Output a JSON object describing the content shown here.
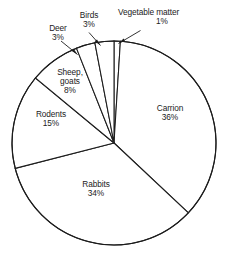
{
  "chart_data": {
    "type": "pie",
    "title": "",
    "subtitle": "",
    "xlabel": "",
    "ylabel": "",
    "grid": false,
    "legend_position": "none",
    "label_style": "slice-labels-with-leader-lines",
    "units": "percent",
    "start_angle_deg": 0,
    "direction": "clockwise",
    "categories": [
      "Vegetable matter",
      "Carrion",
      "Rabbits",
      "Rodents",
      "Sheep, goats",
      "Birds",
      "Deer"
    ],
    "values": [
      1,
      36,
      34,
      15,
      8,
      3,
      3
    ],
    "total": 100,
    "slices": [
      {
        "id": "vegetable",
        "name": "Vegetable matter",
        "value": 1,
        "value_text": "1%",
        "label_placement": "outside",
        "start_pct": 0,
        "end_pct": 1,
        "color": "#ffffff",
        "stroke": "#1c1c1c"
      },
      {
        "id": "carrion",
        "name": "Carrion",
        "value": 36,
        "value_text": "36%",
        "label_placement": "inside",
        "start_pct": 1,
        "end_pct": 37,
        "color": "#ffffff",
        "stroke": "#1c1c1c"
      },
      {
        "id": "rabbits",
        "name": "Rabbits",
        "value": 34,
        "value_text": "34%",
        "label_placement": "inside",
        "start_pct": 37,
        "end_pct": 71,
        "color": "#ffffff",
        "stroke": "#1c1c1c"
      },
      {
        "id": "rodents",
        "name": "Rodents",
        "value": 15,
        "value_text": "15%",
        "label_placement": "inside",
        "start_pct": 71,
        "end_pct": 86,
        "color": "#ffffff",
        "stroke": "#1c1c1c"
      },
      {
        "id": "sheep",
        "name": "Sheep, goats",
        "name_line1": "Sheep,",
        "name_line2": "goats",
        "value": 8,
        "value_text": "8%",
        "label_placement": "inside",
        "start_pct": 86,
        "end_pct": 94,
        "color": "#ffffff",
        "stroke": "#1c1c1c"
      },
      {
        "id": "birds",
        "name": "Birds",
        "value": 3,
        "value_text": "3%",
        "label_placement": "outside",
        "start_pct": 94,
        "end_pct": 97,
        "color": "#ffffff",
        "stroke": "#1c1c1c"
      },
      {
        "id": "deer",
        "name": "Deer",
        "value": 3,
        "value_text": "3%",
        "label_placement": "outside",
        "start_pct": 97,
        "end_pct": 100,
        "color": "#ffffff",
        "stroke": "#1c1c1c"
      }
    ]
  },
  "figure": {
    "background": "#ffffff",
    "line_color": "#1c1c1c",
    "text_color": "#1b1b1b",
    "center_x": 114,
    "center_y": 143,
    "radius": 102
  }
}
